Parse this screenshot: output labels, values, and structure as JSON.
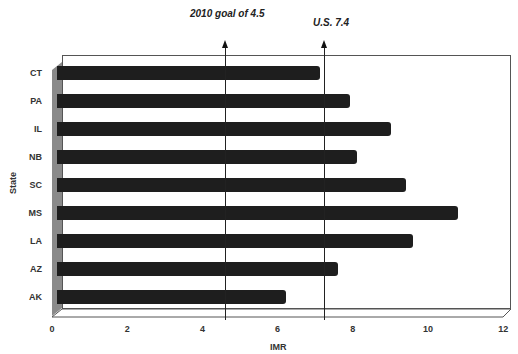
{
  "chart_data": {
    "type": "bar",
    "orientation": "horizontal",
    "title": "",
    "xlabel": "IMR",
    "ylabel": "State",
    "xlim": [
      0,
      12
    ],
    "xticks": [
      0,
      2,
      4,
      6,
      8,
      10,
      12
    ],
    "categories": [
      "CT",
      "PA",
      "IL",
      "NB",
      "SC",
      "MS",
      "LA",
      "AZ",
      "AK"
    ],
    "values": [
      7.0,
      7.8,
      8.9,
      8.0,
      9.3,
      10.7,
      9.5,
      7.5,
      6.1
    ],
    "bar_color": "#1e1e1e",
    "reference_lines": [
      {
        "label": "2010 goal of 4.5",
        "value": 4.5
      },
      {
        "label": "U.S.  7.4",
        "value": 7.4
      }
    ],
    "grid": false,
    "legend": null,
    "style": "3d"
  }
}
